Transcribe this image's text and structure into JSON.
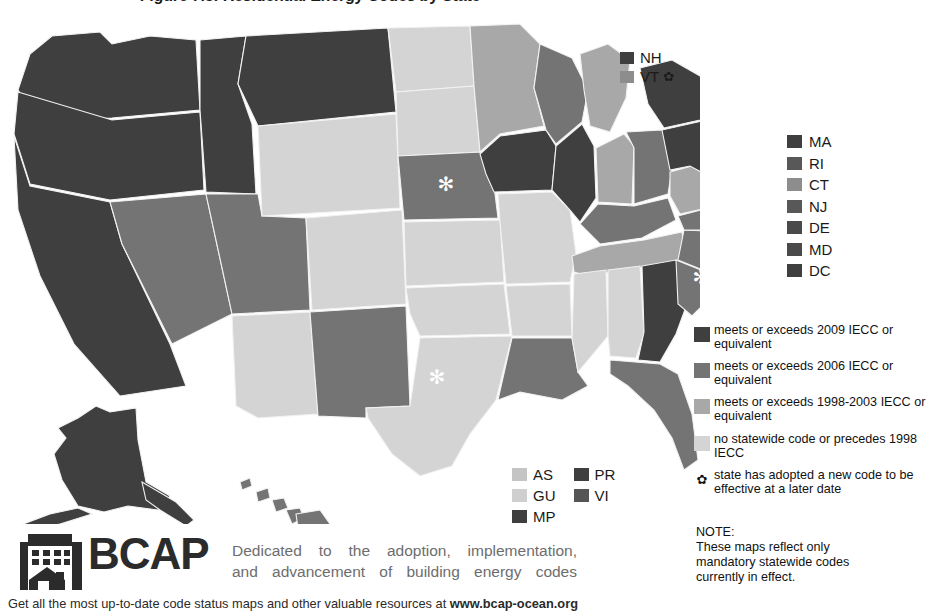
{
  "title": "Figure 7.5: Residential Energy Codes by State",
  "colors": {
    "tier_2009": "#3f3f3f",
    "tier_2006": "#747474",
    "tier_1998_2003": "#a8a8a8",
    "tier_none": "#d4d4d4",
    "border": "#f2f2f2",
    "marker": "#ffffff",
    "text": "#1a1a1a",
    "tagline": "#6d6d6d",
    "logo": "#2b2b2b"
  },
  "nh_vt_callout": {
    "items": [
      {
        "abbr": "NH",
        "color": "#3f3f3f",
        "flower": ""
      },
      {
        "abbr": "VT",
        "color": "#8d8d8d",
        "flower": "✿"
      }
    ]
  },
  "east_states": {
    "items": [
      {
        "abbr": "MA",
        "color": "#3f3f3f"
      },
      {
        "abbr": "RI",
        "color": "#585858"
      },
      {
        "abbr": "CT",
        "color": "#8d8d8d"
      },
      {
        "abbr": "NJ",
        "color": "#585858"
      },
      {
        "abbr": "DE",
        "color": "#4a4a4a"
      },
      {
        "abbr": "MD",
        "color": "#4a4a4a"
      },
      {
        "abbr": "DC",
        "color": "#3f3f3f"
      }
    ]
  },
  "territories": {
    "col1": [
      {
        "abbr": "AS",
        "color": "#c4c4c4"
      },
      {
        "abbr": "GU",
        "color": "#cfcfcf"
      },
      {
        "abbr": "MP",
        "color": "#3f3f3f"
      }
    ],
    "col2": [
      {
        "abbr": "PR",
        "color": "#3f3f3f"
      },
      {
        "abbr": "VI",
        "color": "#555555"
      }
    ]
  },
  "key": {
    "entries": [
      {
        "color": "#3f3f3f",
        "line1": "meets or exceeds 2009 IECC or",
        "line2": "equivalent"
      },
      {
        "color": "#747474",
        "line1": "meets or exceeds 2006 IECC or",
        "line2": "equivalent"
      },
      {
        "color": "#a8a8a8",
        "line1": "meets or exceeds 1998-2003",
        "line2": "IECC or equivalent"
      },
      {
        "color": "#d4d4d4",
        "line1": "no statewide code or precedes",
        "line2": "1998 IECC"
      }
    ],
    "flower_entry": {
      "glyph": "✿",
      "line1": "state has adopted a new code",
      "line2": "to be effective at a later date"
    }
  },
  "note": {
    "head": "NOTE:",
    "line1": "These maps reflect only",
    "line2": "mandatory statewide codes",
    "line3": "currently in effect."
  },
  "footer": {
    "logo_word": "BCAP",
    "tagline_line1": "Dedicated to the adoption, implementation,",
    "tagline_line2": "and advancement of building energy codes",
    "bottom_text": "Get all the most up-to-date code status maps and other valuable resources at ",
    "bottom_url": "www.bcap-ocean.org"
  },
  "map": {
    "markers": [
      {
        "state": "NE",
        "glyph": "✻"
      },
      {
        "state": "TX",
        "glyph": "✻"
      },
      {
        "state": "NC",
        "glyph": "✻"
      }
    ],
    "states": [
      {
        "abbr": "WA",
        "tier": "tier_2009"
      },
      {
        "abbr": "OR",
        "tier": "tier_2009"
      },
      {
        "abbr": "ID",
        "tier": "tier_2009"
      },
      {
        "abbr": "MT",
        "tier": "tier_2009"
      },
      {
        "abbr": "WY",
        "tier": "tier_none"
      },
      {
        "abbr": "CA",
        "tier": "tier_2009"
      },
      {
        "abbr": "NV",
        "tier": "tier_2006"
      },
      {
        "abbr": "UT",
        "tier": "tier_2006"
      },
      {
        "abbr": "CO",
        "tier": "tier_none"
      },
      {
        "abbr": "AZ",
        "tier": "tier_none"
      },
      {
        "abbr": "NM",
        "tier": "tier_2006"
      },
      {
        "abbr": "ND",
        "tier": "tier_none"
      },
      {
        "abbr": "SD",
        "tier": "tier_none"
      },
      {
        "abbr": "NE",
        "tier": "tier_2006"
      },
      {
        "abbr": "KS",
        "tier": "tier_none"
      },
      {
        "abbr": "OK",
        "tier": "tier_1998_2003"
      },
      {
        "abbr": "TX",
        "tier": "tier_1998_2003"
      },
      {
        "abbr": "MN",
        "tier": "tier_1998_2003"
      },
      {
        "abbr": "IA",
        "tier": "tier_2009"
      },
      {
        "abbr": "MO",
        "tier": "tier_none"
      },
      {
        "abbr": "AR",
        "tier": "tier_none"
      },
      {
        "abbr": "LA",
        "tier": "tier_2006"
      },
      {
        "abbr": "WI",
        "tier": "tier_2006"
      },
      {
        "abbr": "IL",
        "tier": "tier_2009"
      },
      {
        "abbr": "MI",
        "tier": "tier_1998_2003"
      },
      {
        "abbr": "IN",
        "tier": "tier_1998_2003"
      },
      {
        "abbr": "OH",
        "tier": "tier_2006"
      },
      {
        "abbr": "KY",
        "tier": "tier_2006"
      },
      {
        "abbr": "TN",
        "tier": "tier_1998_2003"
      },
      {
        "abbr": "MS",
        "tier": "tier_none"
      },
      {
        "abbr": "AL",
        "tier": "tier_none"
      },
      {
        "abbr": "GA",
        "tier": "tier_2009"
      },
      {
        "abbr": "FL",
        "tier": "tier_2006"
      },
      {
        "abbr": "SC",
        "tier": "tier_2006"
      },
      {
        "abbr": "NC",
        "tier": "tier_2006"
      },
      {
        "abbr": "VA",
        "tier": "tier_2006"
      },
      {
        "abbr": "WV",
        "tier": "tier_1998_2003"
      },
      {
        "abbr": "PA",
        "tier": "tier_2009"
      },
      {
        "abbr": "NY",
        "tier": "tier_2009"
      },
      {
        "abbr": "ME",
        "tier": "tier_2009"
      },
      {
        "abbr": "NH",
        "tier": "tier_2009"
      },
      {
        "abbr": "VT",
        "tier": "tier_2006"
      },
      {
        "abbr": "MA",
        "tier": "tier_2009"
      },
      {
        "abbr": "RI",
        "tier": "tier_2009"
      },
      {
        "abbr": "CT",
        "tier": "tier_1998_2003"
      },
      {
        "abbr": "NJ",
        "tier": "tier_2009"
      },
      {
        "abbr": "DE",
        "tier": "tier_2009"
      },
      {
        "abbr": "MD",
        "tier": "tier_2009"
      },
      {
        "abbr": "AK",
        "tier": "tier_2009"
      },
      {
        "abbr": "HI",
        "tier": "tier_2006"
      }
    ]
  }
}
